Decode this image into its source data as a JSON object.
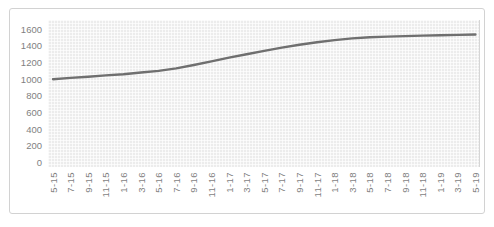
{
  "chart_data": {
    "type": "line",
    "title": "",
    "legend": "none",
    "grid": "fine minor mesh grid, horizontal and vertical",
    "categories": [
      "5-15",
      "7-15",
      "9-15",
      "11-15",
      "1-16",
      "3-16",
      "5-16",
      "7-16",
      "9-16",
      "11-16",
      "1-17",
      "3-17",
      "5-17",
      "7-17",
      "9-17",
      "11-17",
      "1-18",
      "3-18",
      "5-18",
      "7-18",
      "9-18",
      "11-18",
      "1-19",
      "3-19",
      "5-19"
    ],
    "values": [
      1000,
      1015,
      1030,
      1045,
      1060,
      1080,
      1100,
      1130,
      1170,
      1215,
      1260,
      1300,
      1340,
      1380,
      1415,
      1445,
      1470,
      1490,
      1505,
      1512,
      1518,
      1524,
      1529,
      1533,
      1537
    ],
    "xlabel": "",
    "ylabel": "",
    "ylim": [
      0,
      1600
    ],
    "y_ticks": [
      0,
      200,
      400,
      600,
      800,
      1000,
      1200,
      1400,
      1600
    ],
    "x_label_rotation_deg": 90
  },
  "style": {
    "line_color": "#6f6f6f",
    "plot_bg": "#ececec",
    "tick_label_color": "#7f7f7f",
    "frame_border_color": "#d2d2d2",
    "page_background": "#ffffff"
  }
}
